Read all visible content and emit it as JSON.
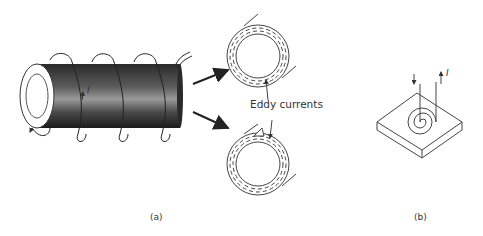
{
  "figure": {
    "panel_a": {
      "caption": "(a)",
      "current_label": "I",
      "annotation": "Eddy currents"
    },
    "panel_b": {
      "caption": "(b)",
      "current_label": "I"
    }
  },
  "colors": {
    "line": "#333333",
    "cylinder_dark": "#1e1e1e",
    "cylinder_light": "#9a9a9a",
    "background": "#ffffff"
  }
}
